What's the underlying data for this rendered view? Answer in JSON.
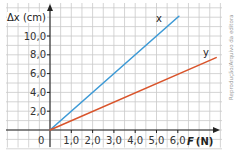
{
  "chart_data": {
    "type": "line",
    "title": "",
    "xlabel": "F (N)",
    "ylabel": "Δx (cm)",
    "x_ticks": [
      "1,0",
      "2,0",
      "3,0",
      "4,0",
      "5,0",
      "6,0"
    ],
    "y_ticks": [
      "2,0",
      "4,0",
      "6,0",
      "8,0",
      "10,0"
    ],
    "origin_label": "0",
    "xlim": [
      0,
      8
    ],
    "ylim": [
      0,
      12.5
    ],
    "grid": true,
    "legend": "inline line labels",
    "series": [
      {
        "name": "x",
        "color": "#3d9ad6",
        "points": [
          [
            0,
            0
          ],
          [
            6.05,
            12.1
          ]
        ]
      },
      {
        "name": "y",
        "color": "#d9542b",
        "points": [
          [
            0,
            0
          ],
          [
            7.8,
            7.7
          ]
        ]
      }
    ],
    "annotations": [
      "Reprodução/Arquivo da editora"
    ]
  },
  "labels": {
    "y_axis": "Δx (cm)",
    "x_axis_italic": "F",
    "x_axis_unit": "(N)",
    "series_x": "x",
    "series_y": "y",
    "origin": "0",
    "credit": "Reprodução/Arquivo da editora"
  }
}
